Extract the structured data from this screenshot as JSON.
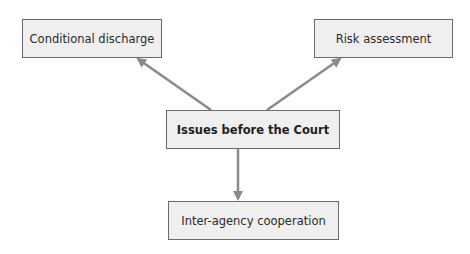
{
  "diagram": {
    "type": "flow",
    "colors": {
      "box_fill": "#efefef",
      "box_border": "#6b6b6b",
      "arrow": "#8a8a8a",
      "background": "#ffffff"
    },
    "nodes": [
      {
        "id": "center",
        "label": "Issues before the Court"
      },
      {
        "id": "top_left",
        "label": "Conditional discharge"
      },
      {
        "id": "top_right",
        "label": "Risk assessment"
      },
      {
        "id": "bottom",
        "label": "Inter-agency cooperation"
      }
    ],
    "edges": [
      {
        "from": "center",
        "to": "top_left"
      },
      {
        "from": "center",
        "to": "top_right"
      },
      {
        "from": "center",
        "to": "bottom"
      }
    ]
  }
}
